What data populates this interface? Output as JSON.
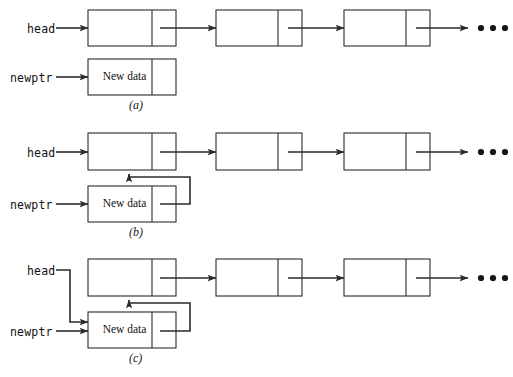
{
  "figure": {
    "colors": {
      "stroke": "#2b2b2b",
      "box_fill": "#ffffff",
      "text": "#111111",
      "background": "#ffffff"
    },
    "panels": [
      {
        "id": "a",
        "caption": "(a)",
        "pointer_labels": [
          {
            "name": "head",
            "text": "head"
          },
          {
            "name": "newptr",
            "text": "newptr"
          }
        ],
        "new_node_label": "New data",
        "list_nodes": 3,
        "ellipsis": "• • •",
        "description": "head points to first list node; newptr points to an unlinked New data node"
      },
      {
        "id": "b",
        "caption": "(b)",
        "pointer_labels": [
          {
            "name": "head",
            "text": "head"
          },
          {
            "name": "newptr",
            "text": "newptr"
          }
        ],
        "new_node_label": "New data",
        "list_nodes": 3,
        "ellipsis": "• • •",
        "description": "New data node next pointer now links to the first list node"
      },
      {
        "id": "c",
        "caption": "(c)",
        "pointer_labels": [
          {
            "name": "head",
            "text": "head"
          },
          {
            "name": "newptr",
            "text": "newptr"
          }
        ],
        "new_node_label": "New data",
        "list_nodes": 3,
        "ellipsis": "• • •",
        "description": "head is reassigned to the New data node, completing the insertion"
      }
    ]
  }
}
